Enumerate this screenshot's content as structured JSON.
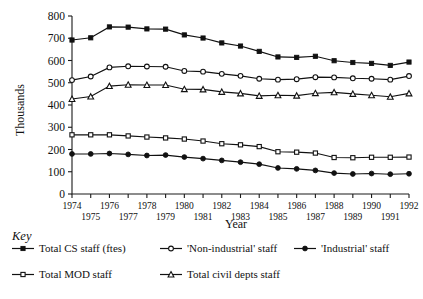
{
  "chart_data": {
    "type": "line",
    "title": "",
    "xlabel": "Year",
    "ylabel": "Thousands",
    "ylim": [
      0,
      800
    ],
    "yticks": [
      0,
      100,
      200,
      300,
      400,
      500,
      600,
      700,
      800
    ],
    "grid": false,
    "legend_position": "below-plot",
    "legend_title": "Key",
    "categories": [
      1974,
      1975,
      1976,
      1977,
      1978,
      1979,
      1980,
      1981,
      1982,
      1983,
      1984,
      1985,
      1986,
      1987,
      1988,
      1989,
      1990,
      1991,
      1992
    ],
    "xtick_labels": [
      "1974",
      "1975",
      "1976",
      "1977",
      "1978",
      "1979",
      "1980",
      "1981",
      "1982",
      "1983",
      "1984",
      "1985",
      "1986",
      "1987",
      "1988",
      "1989",
      "1990",
      "1991",
      "1992"
    ],
    "series": [
      {
        "name": "Total CS staff (ftes)",
        "marker": "filled-square",
        "values": [
          692,
          702,
          751,
          750,
          742,
          741,
          715,
          701,
          679,
          665,
          641,
          616,
          614,
          619,
          599,
          591,
          587,
          578,
          593
        ]
      },
      {
        "name": "'Non-industrial' staff",
        "marker": "open-circle",
        "values": [
          512,
          528,
          569,
          574,
          573,
          572,
          553,
          550,
          540,
          531,
          518,
          514,
          516,
          525,
          524,
          520,
          518,
          514,
          530
        ]
      },
      {
        "name": "'Industrial' staff",
        "marker": "filled-circle",
        "values": [
          180,
          180,
          182,
          178,
          173,
          175,
          166,
          159,
          151,
          143,
          134,
          117,
          113,
          106,
          94,
          90,
          92,
          89,
          91
        ]
      },
      {
        "name": "Total MOD staff",
        "marker": "open-square",
        "values": [
          266,
          266,
          266,
          261,
          256,
          252,
          247,
          238,
          226,
          221,
          213,
          190,
          188,
          184,
          164,
          163,
          165,
          165,
          166
        ]
      },
      {
        "name": "Total civil depts staff",
        "marker": "open-triangle",
        "values": [
          427,
          438,
          485,
          491,
          490,
          490,
          471,
          470,
          459,
          452,
          441,
          444,
          442,
          453,
          457,
          450,
          444,
          437,
          452
        ]
      }
    ]
  },
  "legend": {
    "title": "Key",
    "entries": [
      {
        "label": "Total CS staff (ftes)",
        "marker": "filled-square"
      },
      {
        "label": "'Non-industrial' staff",
        "marker": "open-circle"
      },
      {
        "label": "'Industrial' staff",
        "marker": "filled-circle"
      },
      {
        "label": "Total MOD staff",
        "marker": "open-square"
      },
      {
        "label": "Total civil depts staff",
        "marker": "open-triangle"
      }
    ]
  },
  "axes": {
    "y_title": "Thousands",
    "x_title": "Year"
  }
}
